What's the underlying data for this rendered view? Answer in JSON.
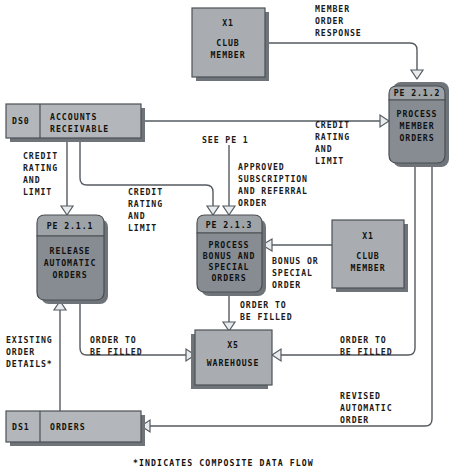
{
  "diagram": {
    "footnote": "*INDICATES COMPOSITE DATA FLOW",
    "colors": {
      "entity_fill": "#a9adb1",
      "process_fill": "#868c91",
      "process_header_fill": "#9ea3a8",
      "store_fill": "#b3b7bb",
      "shadow": "#6e747a",
      "line": "#555b60",
      "text": "#111111",
      "background": "#ffffff"
    },
    "entities": [
      {
        "id": "x1_top",
        "code": "X1",
        "name_line1": "CLUB",
        "name_line2": "MEMBER"
      },
      {
        "id": "x1_right",
        "code": "X1",
        "name_line1": "CLUB",
        "name_line2": "MEMBER"
      },
      {
        "id": "x5",
        "code": "X5",
        "name_line1": "WAREHOUSE",
        "name_line2": ""
      }
    ],
    "processes": [
      {
        "id": "pe212",
        "number": "PE 2.1.2",
        "name_lines": [
          "PROCESS",
          "MEMBER",
          "ORDERS"
        ]
      },
      {
        "id": "pe211",
        "number": "PE 2.1.1",
        "name_lines": [
          "RELEASE",
          "AUTOMATIC",
          "ORDERS"
        ]
      },
      {
        "id": "pe213",
        "number": "PE 2.1.3",
        "name_lines": [
          "PROCESS",
          "BONUS AND",
          "SPECIAL",
          "ORDERS"
        ]
      }
    ],
    "datastores": [
      {
        "id": "ds0",
        "code": "DS0",
        "name_line1": "ACCOUNTS",
        "name_line2": "RECEIVABLE"
      },
      {
        "id": "ds1",
        "code": "DS1",
        "name_line1": "ORDERS",
        "name_line2": ""
      }
    ],
    "flow_labels": [
      {
        "id": "member_order_response",
        "lines": [
          "MEMBER",
          "ORDER",
          "RESPONSE"
        ]
      },
      {
        "id": "credit_rating_limit_left",
        "lines": [
          "CREDIT",
          "RATING",
          "AND",
          "LIMIT"
        ]
      },
      {
        "id": "credit_rating_limit_mid",
        "lines": [
          "CREDIT",
          "RATING",
          "AND",
          "LIMIT"
        ]
      },
      {
        "id": "credit_rating_limit_right",
        "lines": [
          "CREDIT",
          "RATING",
          "AND",
          "LIMIT"
        ]
      },
      {
        "id": "see_pe_1",
        "lines": [
          "SEE PE 1"
        ]
      },
      {
        "id": "approved_subscription",
        "lines": [
          "APPROVED",
          "SUBSCRIPTION",
          "AND REFERRAL",
          "ORDER"
        ]
      },
      {
        "id": "bonus_or_special_order",
        "lines": [
          "BONUS OR",
          "SPECIAL",
          "ORDER"
        ]
      },
      {
        "id": "order_to_be_filled_down",
        "lines": [
          "ORDER TO",
          "BE FILLED"
        ]
      },
      {
        "id": "existing_order_details",
        "lines": [
          "EXISTING",
          "ORDER",
          "DETAILS*"
        ]
      },
      {
        "id": "order_to_be_filled_left",
        "lines": [
          "ORDER TO",
          "BE FILLED"
        ]
      },
      {
        "id": "order_to_be_filled_right",
        "lines": [
          "ORDER TO",
          "BE FILLED"
        ]
      },
      {
        "id": "revised_automatic_order",
        "lines": [
          "REVISED",
          "AUTOMATIC",
          "ORDER"
        ]
      }
    ]
  }
}
